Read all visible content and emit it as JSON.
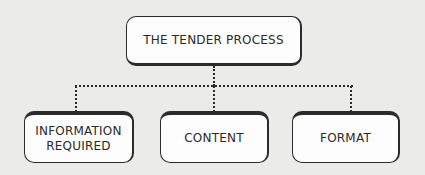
{
  "diagram": {
    "type": "hierarchy",
    "root": {
      "label": "THE TENDER PROCESS"
    },
    "children": [
      {
        "label": "INFORMATION\nREQUIRED",
        "line1": "INFORMATION",
        "line2": "REQUIRED"
      },
      {
        "label": "CONTENT"
      },
      {
        "label": "FORMAT"
      }
    ],
    "connector_style": "dotted",
    "colors": {
      "line": "#2a2a2a",
      "box_fill": "#fdfdfd",
      "background": "#ebebe9"
    }
  }
}
